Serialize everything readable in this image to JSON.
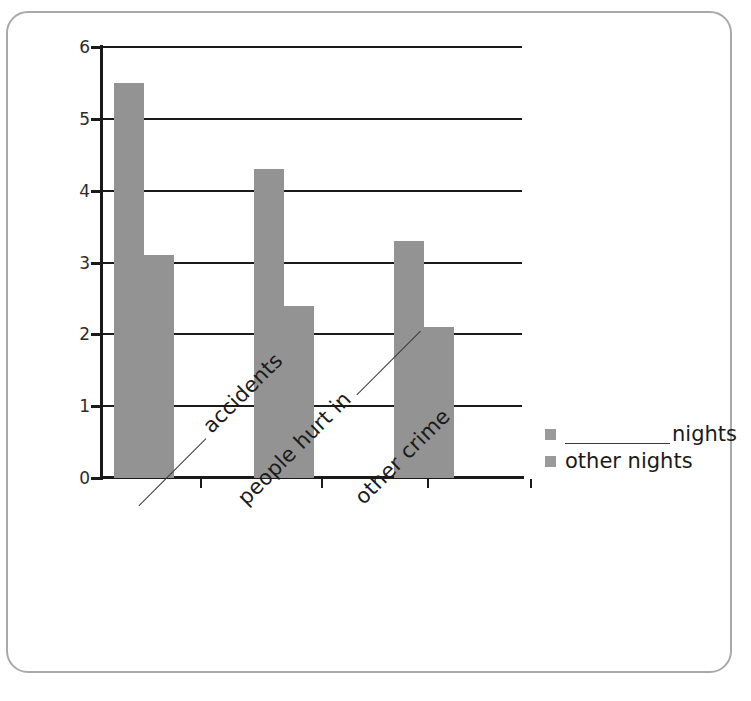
{
  "chart_data": {
    "type": "bar",
    "title": "",
    "subtitle": "",
    "xlabel": "",
    "ylabel": "",
    "ylim": [
      0,
      6
    ],
    "yticks": [
      "0",
      "1",
      "2",
      "3",
      "4",
      "5",
      "6"
    ],
    "grid": true,
    "legend_position": "right",
    "categories": [
      "__________ accidents",
      "people hurt in __________",
      "other crime"
    ],
    "category_parts": [
      {
        "blank_before": true,
        "text": "accidents",
        "blank_after": false
      },
      {
        "blank_before": false,
        "text": "people hurt in",
        "blank_after": true
      },
      {
        "blank_before": false,
        "text": "other crime",
        "blank_after": false
      }
    ],
    "series": [
      {
        "name": "__________ nights",
        "name_text": "nights",
        "blank_before": true,
        "values": [
          5.5,
          4.3,
          3.3
        ],
        "color": "#939393"
      },
      {
        "name": "other nights",
        "name_text": "other nights",
        "blank_before": false,
        "values": [
          3.1,
          2.4,
          2.1
        ],
        "color": "#939393"
      }
    ]
  },
  "legend": {
    "items": [
      {
        "label": "nights",
        "has_blank": true,
        "swatch_color": "#9a9a9a"
      },
      {
        "label": "other nights",
        "has_blank": false,
        "swatch_color": "#9a9a9a"
      }
    ]
  },
  "axes": {
    "y_tick_labels": [
      "0",
      "1",
      "2",
      "3",
      "4",
      "5",
      "6"
    ],
    "axis_color": "#1a1a1a"
  },
  "style": {
    "bar_color": "#939393",
    "frame_color": "#a9a9a9",
    "text_color": "#1a1a1a"
  }
}
